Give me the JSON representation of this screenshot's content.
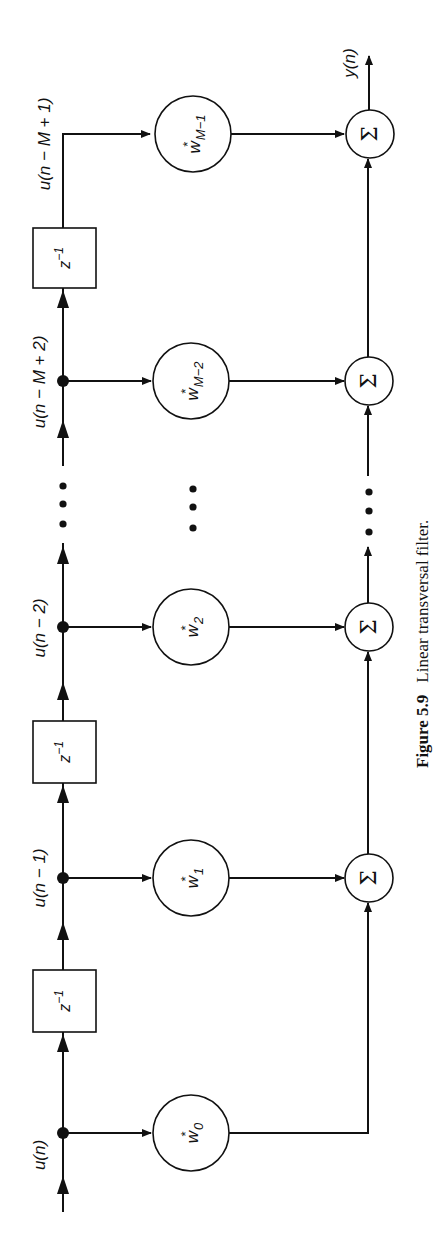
{
  "figure": {
    "number_label": "Figure 5.9",
    "caption": "Linear transversal filter.",
    "orientation": "rotated 90° counter-clockwise"
  },
  "signals": {
    "input": "u(n)",
    "tap1": "u(n − 1)",
    "tap2": "u(n − 2)",
    "tapM2": "u(n − M + 2)",
    "tapM1": "u(n − M + 1)",
    "output": "y(n)"
  },
  "delays": [
    {
      "label": "z",
      "exp": "−1"
    },
    {
      "label": "z",
      "exp": "−1"
    },
    {
      "label": "z",
      "exp": "−1"
    }
  ],
  "weights": [
    {
      "base": "w",
      "sup": "*",
      "sub": "0"
    },
    {
      "base": "w",
      "sup": "*",
      "sub": "1"
    },
    {
      "base": "w",
      "sup": "*",
      "sub": "2"
    },
    {
      "base": "w",
      "sup": "*",
      "sub": "M−2"
    },
    {
      "base": "w",
      "sup": "*",
      "sub": "M−1"
    }
  ],
  "summer_symbol": "Σ",
  "ellipsis": "⋮",
  "colors": {
    "ink": "#111111",
    "background": "#ffffff"
  }
}
